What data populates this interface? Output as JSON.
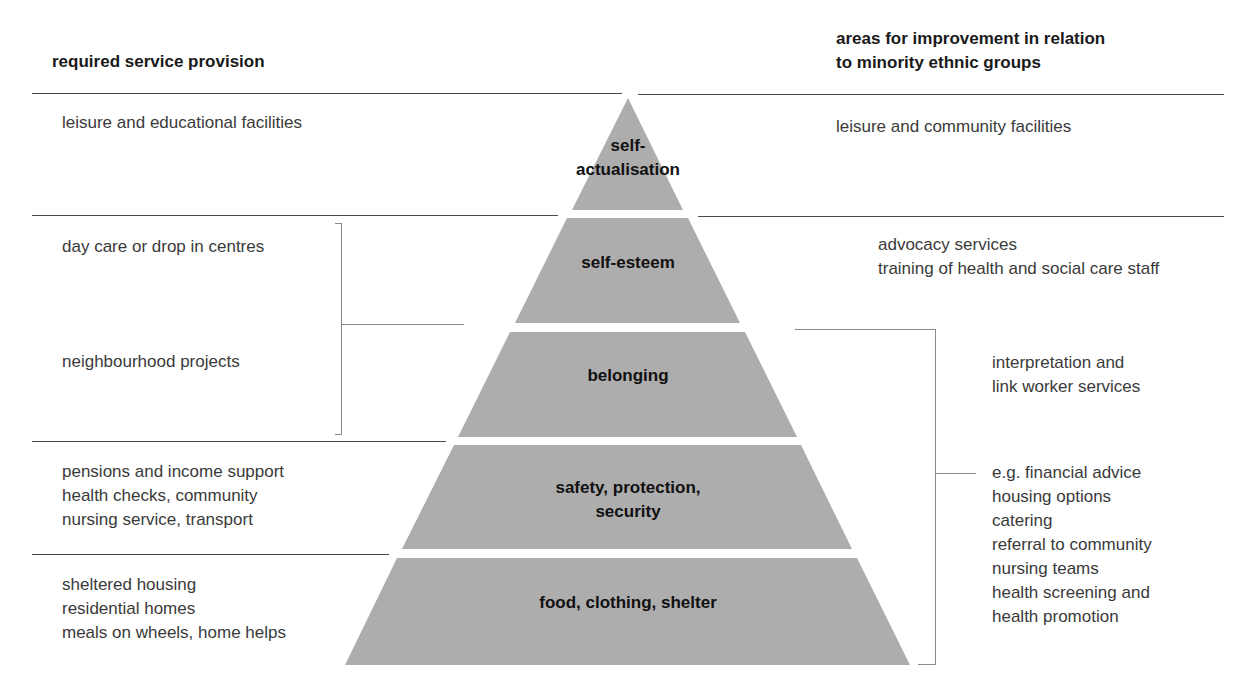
{
  "headers": {
    "left": "required service provision",
    "right": "areas for improvement in relation\nto minority ethnic groups"
  },
  "pyramid": {
    "fill_color": "#acacac",
    "layers": [
      {
        "label": "self-\nactualisation"
      },
      {
        "label": "self-esteem"
      },
      {
        "label": "belonging"
      },
      {
        "label": "safety, protection,\nsecurity"
      },
      {
        "label": "food, clothing, shelter"
      }
    ]
  },
  "left_column": {
    "items": [
      {
        "text": "leisure and educational facilities"
      },
      {
        "text": "day care or drop in centres"
      },
      {
        "text": "neighbourhood projects"
      },
      {
        "text": "pensions and income support\nhealth checks, community\nnursing service, transport"
      },
      {
        "text": "sheltered housing\nresidential homes\nmeals on wheels, home helps"
      }
    ]
  },
  "right_column": {
    "items": [
      {
        "text": "leisure and community facilities"
      },
      {
        "text": "advocacy services\ntraining of health and social care staff"
      },
      {
        "text": "interpretation and\nlink worker services"
      },
      {
        "text": "e.g. financial advice\nhousing options\ncatering\nreferral to community\nnursing teams\nhealth screening and\nhealth promotion"
      }
    ]
  }
}
